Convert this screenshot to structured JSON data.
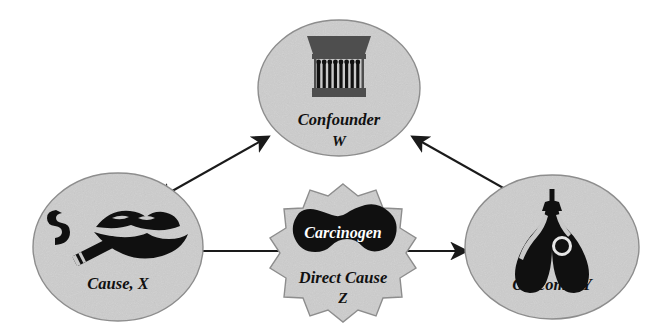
{
  "figure": {
    "type": "causal-diagram",
    "background_color": "#ffffff",
    "node_fill_color": "#dcdcdc",
    "node_stroke_color": "#8d8d8d",
    "ink_color": "#101010"
  },
  "nodes": [
    {
      "id": "confounder",
      "shape": "ellipse",
      "label_line1": "Confounder",
      "label_line2": "W",
      "icon": "matchbox-icon",
      "center": [
        339,
        88
      ]
    },
    {
      "id": "cause",
      "shape": "ellipse",
      "label_line1": "Cause, X",
      "label_line2": "",
      "icon": "smoking-lips-icon",
      "center": [
        118,
        247
      ]
    },
    {
      "id": "direct_cause",
      "shape": "starburst",
      "label_inner": "Carcinogen",
      "label_line1": "Direct Cause",
      "label_line2": "Z",
      "icon": "carcinogen-blob-icon",
      "center": [
        343,
        251
      ]
    },
    {
      "id": "outcome",
      "shape": "ellipse",
      "label_line1": "Outcome, Y",
      "label_line2": "",
      "icon": "lungs-icon",
      "center": [
        552,
        247
      ]
    }
  ],
  "edges": [
    {
      "id": "cause-confounder",
      "from": "cause",
      "to": "confounder",
      "arrow": "double"
    },
    {
      "id": "confounder-outcome",
      "from": "confounder",
      "to": "outcome",
      "arrow": "double"
    },
    {
      "id": "cause-direct",
      "from": "cause",
      "to": "direct_cause",
      "arrow": "none"
    },
    {
      "id": "direct-outcome",
      "from": "direct_cause",
      "to": "outcome",
      "arrow": "single"
    }
  ]
}
